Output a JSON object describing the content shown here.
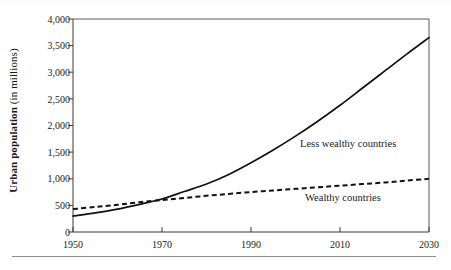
{
  "chart_data": {
    "type": "line",
    "title": "",
    "xlabel": "",
    "ylabel": "Urban population (in millions)",
    "ylabel_bold_part": "Urban population",
    "ylabel_regular_part": "(in millions)",
    "xlim": [
      1950,
      2030
    ],
    "ylim": [
      0,
      4000
    ],
    "grid": false,
    "legend_position": "inline-annotations",
    "x_ticks": [
      1950,
      1970,
      1990,
      2010,
      2030
    ],
    "x_tick_labels": [
      "1950",
      "1970",
      "1990",
      "2010",
      "2030"
    ],
    "y_ticks": [
      0,
      500,
      1000,
      1500,
      2000,
      2500,
      3000,
      3500,
      4000
    ],
    "y_tick_labels": [
      "0",
      "500",
      "1,000",
      "1,500",
      "2,000",
      "2,500",
      "3,000",
      "3,500",
      "4,000"
    ],
    "x": [
      1950,
      1955,
      1960,
      1965,
      1970,
      1975,
      1980,
      1985,
      1990,
      1995,
      2000,
      2005,
      2010,
      2015,
      2020,
      2025,
      2030
    ],
    "series": [
      {
        "name": "Less wealthy countries",
        "style": "solid",
        "color": "#111111",
        "label_x": 1992,
        "label_y": 1800,
        "values": [
          300,
          360,
          430,
          520,
          620,
          760,
          900,
          1080,
          1300,
          1540,
          1800,
          2080,
          2380,
          2700,
          3020,
          3340,
          3650
        ]
      },
      {
        "name": "Wealthy countries",
        "style": "dashed",
        "color": "#111111",
        "label_x": 1996,
        "label_y": 700,
        "values": [
          430,
          470,
          510,
          560,
          600,
          640,
          680,
          715,
          750,
          780,
          810,
          840,
          870,
          900,
          930,
          965,
          1000
        ]
      }
    ],
    "annotations": [
      {
        "text": "Less wealthy countries",
        "name": "less-wealthy-countries-label"
      },
      {
        "text": "Wealthy countries",
        "name": "wealthy-countries-label"
      }
    ]
  },
  "axis": {
    "y_title_bold": "Urban population",
    "y_title_regular": "(in millions)"
  },
  "labels": {
    "y": [
      "4,000",
      "3,500",
      "3,000",
      "2,500",
      "2,000",
      "1,500",
      "1,000",
      "500",
      "0"
    ],
    "x": [
      "1950",
      "1970",
      "1990",
      "2010",
      "2030"
    ],
    "series_less": "Less wealthy countries",
    "series_wealthy": "Wealthy countries"
  },
  "colors": {
    "ink": "#111111",
    "frame": "#555555",
    "rule": "#8d8d8d"
  }
}
